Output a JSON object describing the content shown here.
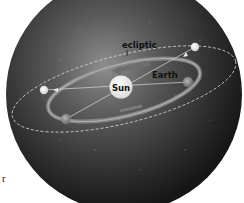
{
  "diagram": {
    "labels": {
      "ecliptic": "ecliptic",
      "earth": "Earth",
      "sun": "Sun"
    },
    "edge_fragment": "r",
    "colors": {
      "background": "#ffffff",
      "sphere_light": "#8a8a8a",
      "sphere_dark": "#1a1a1a",
      "orbit": "#9a9a9a",
      "ecliptic_line": "#cfcfcf",
      "sun": "#f4f4f4",
      "label_text": "#111111"
    },
    "elements": [
      {
        "name": "celestial-sphere",
        "shape": "circle"
      },
      {
        "name": "ecliptic",
        "shape": "dashed ellipse"
      },
      {
        "name": "earth-orbit",
        "shape": "ellipse with direction arrow"
      },
      {
        "name": "sun",
        "shape": "circle",
        "label": "Sun"
      },
      {
        "name": "earth-position-1",
        "position": "right of Sun"
      },
      {
        "name": "earth-position-2",
        "position": "lower left of Sun"
      },
      {
        "name": "projected-sun-1",
        "position": "upper right on ecliptic"
      },
      {
        "name": "projected-sun-2",
        "position": "left on ecliptic"
      }
    ]
  }
}
